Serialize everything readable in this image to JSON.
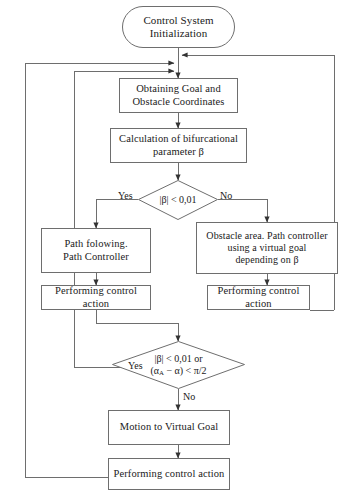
{
  "diagram": {
    "type": "flowchart",
    "stroke_color": "#6e6e6e",
    "text_color": "#1a1a1a",
    "background": "#ffffff",
    "nodes": [
      {
        "id": "start",
        "shape": "terminator",
        "lines": [
          "Control System",
          "Initialization"
        ]
      },
      {
        "id": "obtain",
        "shape": "process",
        "lines": [
          "Obtaining Goal and",
          "Obstacle Coordinates"
        ]
      },
      {
        "id": "calc",
        "shape": "process",
        "lines": [
          "Calculation of bifurcational",
          "parameter β"
        ]
      },
      {
        "id": "decision1",
        "shape": "decision",
        "lines": [
          "|β| < 0,01"
        ]
      },
      {
        "id": "pathfollow",
        "shape": "process",
        "lines": [
          "Path folowing.",
          "Path Controller"
        ]
      },
      {
        "id": "obstacle",
        "shape": "process",
        "lines": [
          "Obstacle area. Path controller",
          "using a virtual goal",
          "depending on  β"
        ]
      },
      {
        "id": "perform1",
        "shape": "process",
        "lines": [
          "Performing control action"
        ]
      },
      {
        "id": "perform2",
        "shape": "process",
        "lines": [
          "Performing control action"
        ]
      },
      {
        "id": "decision2",
        "shape": "decision",
        "lines": [
          "|β| < 0,01 or",
          "(αA − α) < π/2"
        ]
      },
      {
        "id": "motion",
        "shape": "process",
        "lines": [
          "Motion to Virtual Goal"
        ]
      },
      {
        "id": "perform3",
        "shape": "process",
        "lines": [
          "Performing control action"
        ]
      }
    ],
    "edge_labels": [
      {
        "id": "d1-yes",
        "text": "Yes"
      },
      {
        "id": "d1-no",
        "text": "No"
      },
      {
        "id": "d2-yes",
        "text": "Yes"
      },
      {
        "id": "d2-no",
        "text": "No"
      }
    ]
  },
  "nodes": {
    "start": {
      "l1": "Control System",
      "l2": "Initialization"
    },
    "obtain": {
      "l1": "Obtaining Goal and",
      "l2": "Obstacle Coordinates"
    },
    "calc": {
      "l1": "Calculation of bifurcational",
      "l2": "parameter β"
    },
    "decision1": {
      "l1": "|β| < 0,01"
    },
    "pathfollow": {
      "l1": "Path folowing.",
      "l2": "Path Controller"
    },
    "obstacle": {
      "l1": "Obstacle area. Path controller",
      "l2": "using a virtual goal",
      "l3": "depending on  β"
    },
    "perform1": {
      "l1": "Performing control action"
    },
    "perform2": {
      "l1": "Performing control action"
    },
    "decision2": {
      "l1": "|β| < 0,01 or",
      "l2a": "(α",
      "l2b": "A",
      "l2c": " − α) < π/2"
    },
    "motion": {
      "l1": "Motion to Virtual Goal"
    },
    "perform3": {
      "l1": "Performing control action"
    }
  },
  "labels": {
    "d1_yes": "Yes",
    "d1_no": "No",
    "d2_yes": "Yes",
    "d2_no": "No"
  }
}
